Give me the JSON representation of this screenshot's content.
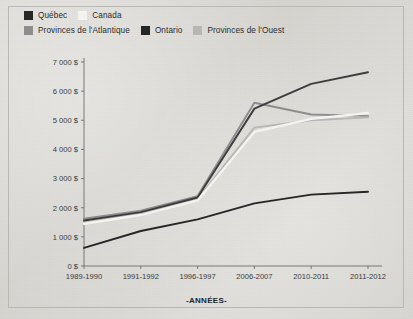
{
  "figure": {
    "background_color": "#d7d6d2",
    "frame_color": "#b9b8b3"
  },
  "legend": {
    "position": "top-left",
    "rows": [
      [
        {
          "label": "Québec",
          "color": "#262626"
        },
        {
          "label": "Canada",
          "color": "#f4f3ef"
        }
      ],
      [
        {
          "label": "Provinces de l'Atlantique",
          "color": "#8d8d8d"
        },
        {
          "label": "Ontario",
          "color": "#262626"
        },
        {
          "label": "Provinces de l'Ouest",
          "color": "#b6b6b4"
        }
      ]
    ]
  },
  "axes": {
    "y_ticks": [
      "0 $",
      "1 000 $",
      "2 000 $",
      "3 000 $",
      "4 000 $",
      "5 000 $",
      "6 000 $",
      "7 000 $"
    ],
    "x_title": "-ANNÉES-"
  },
  "chart_data": {
    "type": "line",
    "title": "",
    "xlabel": "-ANNÉES-",
    "ylabel": "",
    "categories": [
      "1989-1990",
      "1991-1992",
      "1996-1997",
      "2006-2007",
      "2010-2011",
      "2011-2012"
    ],
    "ylim": [
      0,
      7000
    ],
    "ytick_values": [
      0,
      1000,
      2000,
      3000,
      4000,
      5000,
      6000,
      7000
    ],
    "ytick_labels": [
      "0 $",
      "1 000 $",
      "2 000 $",
      "3 000 $",
      "4 000 $",
      "5 000 $",
      "6 000 $",
      "7 000 $"
    ],
    "grid": false,
    "legend_position": "top-left",
    "series": [
      {
        "name": "Québec",
        "color": "#262626",
        "values": [
          620,
          1200,
          1600,
          2150,
          2450,
          2550
        ]
      },
      {
        "name": "Canada",
        "color": "#f4f3ef",
        "values": [
          1450,
          1750,
          2250,
          4600,
          5050,
          5250
        ]
      },
      {
        "name": "Provinces de l'Atlantique",
        "color": "#8d8d8d",
        "values": [
          1620,
          1900,
          2400,
          5600,
          5200,
          5150
        ]
      },
      {
        "name": "Ontario",
        "color": "#3d3d3d",
        "values": [
          1560,
          1850,
          2350,
          5400,
          6250,
          6650
        ]
      },
      {
        "name": "Provinces de l'Ouest",
        "color": "#b6b6b4",
        "values": [
          1500,
          1800,
          2300,
          4750,
          5000,
          5100
        ]
      }
    ]
  }
}
